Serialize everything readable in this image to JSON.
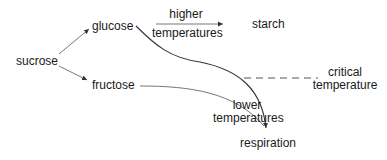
{
  "nodes": {
    "sucrose": "sucrose",
    "glucose": "glucose",
    "fructose": "fructose",
    "starch": "starch",
    "respiration": "respiration"
  },
  "edge_labels": {
    "higher_line1": "higher",
    "higher_line2": "temperatures",
    "lower_line1": "lower",
    "lower_line2": "temperatures"
  },
  "threshold": {
    "line1": "critical",
    "line2": "temperature",
    "style": "dashed"
  },
  "edges": [
    {
      "from": "sucrose",
      "to": "glucose",
      "type": "arrow"
    },
    {
      "from": "sucrose",
      "to": "fructose",
      "type": "arrow"
    },
    {
      "from": "glucose",
      "to": "starch",
      "type": "arrow",
      "label": "higher temperatures"
    },
    {
      "from": "glucose",
      "to": "respiration",
      "type": "curved-arrow"
    },
    {
      "from": "fructose",
      "to": "respiration",
      "type": "curved-arrow",
      "label": "lower temperatures"
    }
  ],
  "colors": {
    "line": "#333333",
    "text": "#1a1a1a",
    "background": "#ffffff"
  }
}
